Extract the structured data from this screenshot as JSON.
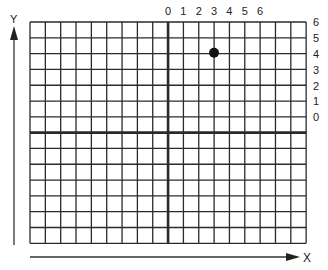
{
  "axes": {
    "y_label": "Y",
    "x_label": "X"
  },
  "top_labels": [
    "0",
    "1",
    "2",
    "3",
    "4",
    "5",
    "6"
  ],
  "right_labels": [
    "6",
    "5",
    "4",
    "3",
    "2",
    "1",
    "0"
  ],
  "grid": {
    "cols_left": 9,
    "cols_right": 9,
    "rows_above": 7,
    "rows_below": 7
  },
  "point": {
    "x": 3,
    "y": 5
  },
  "colors": {
    "line": "#222222",
    "point": "#111111"
  }
}
